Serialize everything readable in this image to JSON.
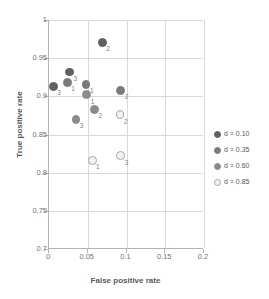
{
  "chart_data": {
    "type": "scatter",
    "title": "",
    "xlabel": "False positive rate",
    "ylabel": "True positive rate",
    "xlim": [
      0,
      0.2
    ],
    "ylim": [
      0.7,
      1
    ],
    "xticks": [
      "0",
      "0.05",
      "0.1",
      "0.15",
      "0.2"
    ],
    "xtick_values": [
      0,
      0.05,
      0.1,
      0.15,
      0.2
    ],
    "yticks": [
      "0.7",
      "0.75",
      "0.8",
      "0.85",
      "0.9",
      "0.95",
      "1"
    ],
    "ytick_values": [
      0.7,
      0.75,
      0.8,
      0.85,
      0.9,
      0.95,
      1
    ],
    "grid": true,
    "legend_position": "right",
    "series": [
      {
        "name": "d = 0.10",
        "color": "#606060",
        "filled": true,
        "points": [
          {
            "label": "3",
            "x": 0.007,
            "y": 0.913
          },
          {
            "label": "3",
            "x": 0.028,
            "y": 0.932
          },
          {
            "label": "2",
            "x": 0.07,
            "y": 0.971
          }
        ]
      },
      {
        "name": "d = 0.35",
        "color": "#7a7a7a",
        "filled": true,
        "points": [
          {
            "label": "1",
            "x": 0.025,
            "y": 0.918
          },
          {
            "label": "1",
            "x": 0.049,
            "y": 0.916
          },
          {
            "label": "2",
            "x": 0.094,
            "y": 0.908
          }
        ]
      },
      {
        "name": "d = 0.60",
        "color": "#8c8c8c",
        "filled": true,
        "points": [
          {
            "label": "1",
            "x": 0.05,
            "y": 0.902
          },
          {
            "label": "2",
            "x": 0.06,
            "y": 0.883
          },
          {
            "label": "3",
            "x": 0.036,
            "y": 0.87
          }
        ]
      },
      {
        "name": "d = 0.85",
        "color": "#f2f2f2",
        "filled": false,
        "points": [
          {
            "label": "2",
            "x": 0.093,
            "y": 0.876
          },
          {
            "label": "1",
            "x": 0.057,
            "y": 0.816
          },
          {
            "label": "3",
            "x": 0.094,
            "y": 0.822
          }
        ]
      }
    ]
  },
  "legend": {
    "items": [
      {
        "label": "d = 0.10"
      },
      {
        "label": "d = 0.35"
      },
      {
        "label": "d = 0.60"
      },
      {
        "label": "d = 0.85"
      }
    ]
  },
  "axes": {
    "x_title": "False positive rate",
    "y_title": "True positive rate"
  }
}
